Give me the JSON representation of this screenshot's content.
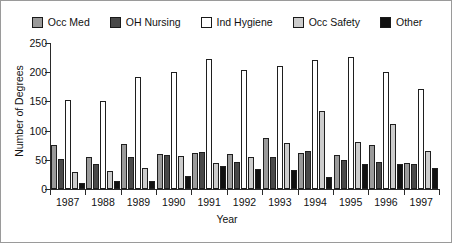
{
  "chart_data": {
    "type": "bar",
    "title": "",
    "xlabel": "Year",
    "ylabel": "Number of Degrees",
    "categories": [
      "1987",
      "1988",
      "1989",
      "1990",
      "1991",
      "1992",
      "1993",
      "1994",
      "1995",
      "1996",
      "1997"
    ],
    "ylim": [
      0,
      250
    ],
    "yticks": [
      0,
      50,
      100,
      150,
      200,
      250
    ],
    "grid": false,
    "legend_position": "top",
    "series": [
      {
        "name": "Occ Med",
        "color": "#9a9a9a",
        "values": [
          75,
          55,
          77,
          60,
          62,
          60,
          88,
          62,
          58,
          75,
          45
        ]
      },
      {
        "name": "OH Nursing",
        "color": "#494949",
        "values": [
          52,
          43,
          55,
          58,
          63,
          47,
          55,
          65,
          50,
          47,
          42
        ]
      },
      {
        "name": "Ind Hygiene",
        "color": "#ffffff",
        "values": [
          153,
          150,
          192,
          200,
          222,
          203,
          210,
          221,
          226,
          200,
          171
        ]
      },
      {
        "name": "Occ Safety",
        "color": "#cccccc",
        "values": [
          29,
          31,
          36,
          57,
          45,
          55,
          78,
          133,
          80,
          112,
          65
        ]
      },
      {
        "name": "Other",
        "color": "#111111",
        "values": [
          10,
          13,
          14,
          22,
          40,
          35,
          33,
          20,
          43,
          42,
          36
        ]
      }
    ]
  }
}
